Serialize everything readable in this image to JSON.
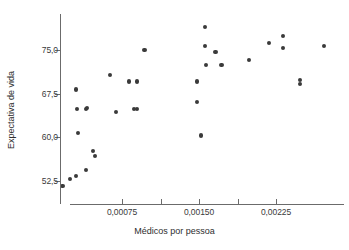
{
  "chart_data": {
    "type": "scatter",
    "title": "",
    "xlabel": "Médicos por pessoa",
    "ylabel": "Expectativa de vida",
    "xtick_labels": [
      "0,00075",
      "0,00150",
      "0,00225"
    ],
    "xtick_values": [
      0.00075,
      0.0015,
      0.00225
    ],
    "xminor_ticks": [
      0.001125,
      0.001875
    ],
    "ytick_labels": [
      "75,0",
      "67,5",
      "60,0",
      "52,5"
    ],
    "ytick_values": [
      75.0,
      67.5,
      60.0,
      52.5
    ],
    "xlim": [
      0.00012,
      0.00283
    ],
    "ylim": [
      50.5,
      79.5
    ],
    "grid": false,
    "legend": null,
    "marker_color": "#3a3a3a",
    "axis_color": "#6b6b6b",
    "points": [
      {
        "x": 0.00017,
        "y": 51.6
      },
      {
        "x": 0.00024,
        "y": 52.9
      },
      {
        "x": 0.0003,
        "y": 53.3
      },
      {
        "x": 0.0004,
        "y": 54.4
      },
      {
        "x": 0.00047,
        "y": 57.7
      },
      {
        "x": 0.00049,
        "y": 56.8
      },
      {
        "x": 0.00032,
        "y": 60.8
      },
      {
        "x": 0.00031,
        "y": 64.8
      },
      {
        "x": 0.0004,
        "y": 64.8
      },
      {
        "x": 0.00041,
        "y": 65.0
      },
      {
        "x": 0.0003,
        "y": 68.2
      },
      {
        "x": 0.00063,
        "y": 70.7
      },
      {
        "x": 0.00069,
        "y": 64.4
      },
      {
        "x": 0.00082,
        "y": 69.6
      },
      {
        "x": 0.0009,
        "y": 69.6
      },
      {
        "x": 0.00087,
        "y": 64.8
      },
      {
        "x": 0.0009,
        "y": 64.8
      },
      {
        "x": 0.00097,
        "y": 75.0
      },
      {
        "x": 0.00148,
        "y": 66.0
      },
      {
        "x": 0.00152,
        "y": 60.3
      },
      {
        "x": 0.00148,
        "y": 69.6
      },
      {
        "x": 0.00156,
        "y": 79.0
      },
      {
        "x": 0.00156,
        "y": 75.7
      },
      {
        "x": 0.00157,
        "y": 72.4
      },
      {
        "x": 0.00166,
        "y": 74.6
      },
      {
        "x": 0.00172,
        "y": 72.4
      },
      {
        "x": 0.00199,
        "y": 73.3
      },
      {
        "x": 0.00218,
        "y": 76.2
      },
      {
        "x": 0.00232,
        "y": 77.4
      },
      {
        "x": 0.00232,
        "y": 75.4
      },
      {
        "x": 0.00248,
        "y": 69.8
      },
      {
        "x": 0.00248,
        "y": 69.2
      },
      {
        "x": 0.00272,
        "y": 75.7
      }
    ]
  },
  "axes": {
    "x_pixel_at_zero": 45,
    "x_pixels_per_unit": 102667,
    "y_pixel_at_75": 50,
    "y_pixels_per_unit": 5.822
  }
}
